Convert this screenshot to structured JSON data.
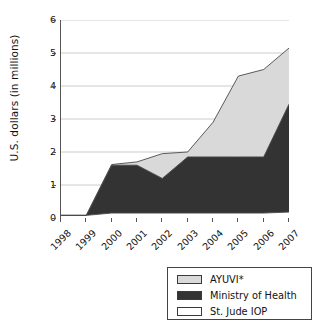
{
  "chart_data": {
    "type": "area",
    "title": "",
    "subtitle": "",
    "xlabel": "",
    "ylabel": "U.S. dollars (in millions)",
    "categories": [
      "1998",
      "1999",
      "2000",
      "2001",
      "2002",
      "2003",
      "2004",
      "2005",
      "2006",
      "2007"
    ],
    "x": [
      1998,
      1999,
      2000,
      2001,
      2002,
      2003,
      2004,
      2005,
      2006,
      2007
    ],
    "stacked": true,
    "stack_order_bottom_to_top": [
      "St. Jude IOP",
      "Ministry of Health",
      "AYUVI*"
    ],
    "series": [
      {
        "name": "St. Jude IOP",
        "color": "#ffffff",
        "values": [
          0.08,
          0.08,
          0.15,
          0.15,
          0.15,
          0.15,
          0.15,
          0.15,
          0.15,
          0.18
        ]
      },
      {
        "name": "Ministry of Health",
        "color": "#333333",
        "values": [
          0.0,
          0.0,
          1.45,
          1.45,
          1.05,
          1.7,
          1.7,
          1.7,
          1.7,
          3.27
        ]
      },
      {
        "name": "AYUVI*",
        "color": "#d9d9d9",
        "values": [
          0.0,
          0.0,
          0.02,
          0.1,
          0.75,
          0.15,
          1.05,
          1.45,
          1.65,
          1.7
        ]
      }
    ],
    "cumulative_totals": [
      0.08,
      0.08,
      1.62,
      1.7,
      1.95,
      2.0,
      2.9,
      3.3,
      3.5,
      5.15
    ],
    "stack_tops": {
      "St. Jude IOP": [
        0.08,
        0.08,
        0.15,
        0.15,
        0.15,
        0.15,
        0.15,
        0.15,
        0.15,
        0.18
      ],
      "Ministry of Health": [
        0.08,
        0.08,
        1.6,
        1.6,
        1.2,
        1.85,
        1.85,
        1.85,
        1.85,
        3.45
      ],
      "AYUVI*": [
        0.08,
        0.08,
        1.62,
        1.7,
        1.95,
        2.0,
        2.9,
        4.3,
        4.5,
        5.15
      ]
    },
    "ylim": [
      0,
      6
    ],
    "yticks": [
      0,
      1,
      2,
      3,
      4,
      5,
      6
    ],
    "ytick_labels": [
      "0",
      "1",
      "2",
      "3",
      "4",
      "5",
      "6"
    ],
    "grid": true,
    "grid_axis": "y",
    "legend_position": "bottom-right",
    "legend_entries": [
      {
        "label": "AYUVI*",
        "swatch": "#d9d9d9"
      },
      {
        "label": "Ministry of Health",
        "swatch": "#333333"
      },
      {
        "label": "St. Jude IOP",
        "swatch": "#ffffff"
      }
    ],
    "xtick_label_rotation": -45
  },
  "colors": {
    "ayuvi": "#d9d9d9",
    "ministry": "#333333",
    "stjude": "#ffffff",
    "axis": "#555555",
    "grid": "#bfbfbf",
    "series_outline": "#4a4a4a",
    "text": "#111111"
  }
}
